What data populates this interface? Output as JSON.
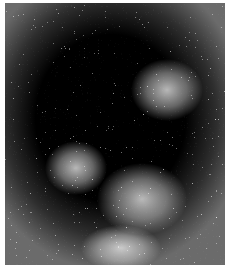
{
  "image": {
    "kind": "scanned-halftone-speckle-texture",
    "title": "Binary speckle micrograph scan",
    "width": 232,
    "height": 270,
    "background_color": "#ffffff",
    "speckle_color": "#101010",
    "description": "Dense random black speckle / halftone grain filling the frame on white paper with thin white margins",
    "has_text": false,
    "has_axes": false,
    "has_legend": false,
    "margins": {
      "top": 3,
      "right": 7,
      "bottom": 5,
      "left": 5
    },
    "texture": {
      "grain_scale_coarse": 0.62,
      "grain_scale_fine": 1.05,
      "grain_scale_clump": 0.14,
      "octaves_coarse": 4,
      "octaves_fine": 3,
      "octaves_clump": 5,
      "threshold_coarse": 0.52,
      "threshold_fine": 0.58,
      "threshold_clump": 0.46,
      "coverage_estimate_percent": 38,
      "seed_coarse": 17,
      "seed_fine": 91,
      "seed_clump": 43
    },
    "density_regions": [
      {
        "name": "upper-left-dark",
        "cx": 22,
        "cy": 14,
        "rx": 34,
        "ry": 26,
        "type": "dark"
      },
      {
        "name": "upper-center-dark",
        "cx": 56,
        "cy": 20,
        "rx": 30,
        "ry": 22,
        "type": "dark"
      },
      {
        "name": "upper-right-dark",
        "cx": 82,
        "cy": 16,
        "rx": 26,
        "ry": 20,
        "type": "dark"
      },
      {
        "name": "mid-left-dark",
        "cx": 14,
        "cy": 48,
        "rx": 22,
        "ry": 24,
        "type": "dark"
      },
      {
        "name": "center-band-dark",
        "cx": 50,
        "cy": 46,
        "rx": 30,
        "ry": 20,
        "type": "dark"
      },
      {
        "name": "right-mid-dark",
        "cx": 88,
        "cy": 58,
        "rx": 22,
        "ry": 26,
        "type": "dark"
      },
      {
        "name": "lower-left-dark",
        "cx": 18,
        "cy": 80,
        "rx": 24,
        "ry": 22,
        "type": "dark"
      },
      {
        "name": "lower-right-dark",
        "cx": 78,
        "cy": 88,
        "rx": 28,
        "ry": 20,
        "type": "dark"
      },
      {
        "name": "center-light",
        "cx": 62,
        "cy": 76,
        "rx": 20,
        "ry": 16,
        "type": "light"
      },
      {
        "name": "right-upper-light",
        "cx": 74,
        "cy": 34,
        "rx": 16,
        "ry": 14,
        "type": "light"
      },
      {
        "name": "left-lower-light",
        "cx": 30,
        "cy": 64,
        "rx": 14,
        "ry": 12,
        "type": "light"
      },
      {
        "name": "bottom-center-light",
        "cx": 52,
        "cy": 94,
        "rx": 18,
        "ry": 10,
        "type": "light"
      }
    ]
  }
}
